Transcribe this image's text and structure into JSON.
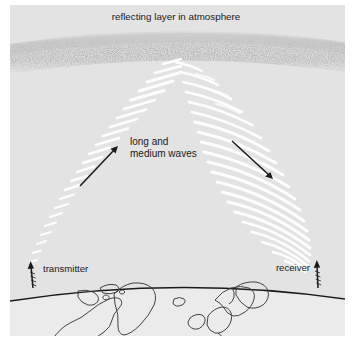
{
  "figure": {
    "name": "ionospheric-radio-wave-propagation-diagram",
    "background_color": "#ffffff",
    "panel_color": "#e3e3e3",
    "panel_bounds": {
      "x": 10,
      "y": 5,
      "width": 335,
      "height": 331
    }
  },
  "labels": {
    "title": "reflecting layer in atmosphere",
    "waves_line1": "long and",
    "waves_line2": "medium waves",
    "transmitter": "transmitter",
    "receiver": "receiver"
  },
  "colors": {
    "panel": "#e3e3e3",
    "beam_ray": "#ffffff",
    "ink": "#1a1a1a",
    "speckle": "#8a8a8a",
    "earth_fill": "#ebebeb",
    "coastline": "#3a3a3a"
  },
  "elements": {
    "reflecting_layer": {
      "name": "reflecting-layer-band",
      "description": "stippled speckled band across upper area",
      "y_center_left": 55,
      "y_center_mid": 40,
      "y_center_right": 53,
      "thickness": 22
    },
    "apex": {
      "x": 176,
      "y": 60
    },
    "transmitter_antenna": {
      "x": 33,
      "y": 265,
      "height": 24
    },
    "receiver_antenna": {
      "x": 318,
      "y": 263,
      "height": 24
    },
    "upward_beam": {
      "name": "transmitter-to-layer-beam",
      "from": {
        "x": 33,
        "y": 264
      },
      "to": {
        "x": 172,
        "y": 62
      },
      "ray_count": 22
    },
    "downward_beam": {
      "name": "layer-to-receiver-beam",
      "from": {
        "x": 180,
        "y": 62
      },
      "to": {
        "x": 317,
        "y": 262
      },
      "ray_count": 24
    },
    "arrow_up": {
      "name": "upward-propagation-arrow",
      "from": {
        "x": 80,
        "y": 186
      },
      "to": {
        "x": 118,
        "y": 146
      }
    },
    "arrow_down": {
      "name": "downward-propagation-arrow",
      "from": {
        "x": 232,
        "y": 141
      },
      "to": {
        "x": 273,
        "y": 179
      }
    },
    "horizon": {
      "name": "earth-horizon-arc",
      "left": {
        "x": 10,
        "y": 301
      },
      "peak": {
        "x": 178,
        "y": 282
      },
      "right": {
        "x": 345,
        "y": 299
      }
    }
  },
  "map_features": [
    "north-america-coast",
    "greenland",
    "iceland",
    "scandinavia",
    "british-isles"
  ]
}
